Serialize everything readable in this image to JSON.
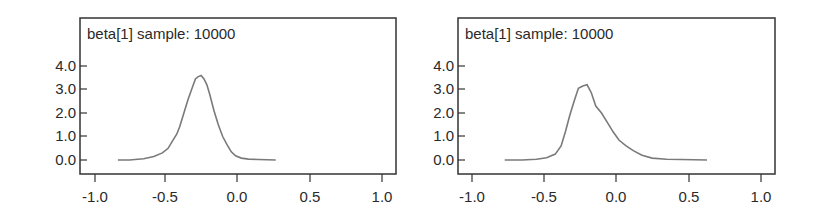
{
  "chart_data": [
    {
      "type": "line",
      "title": "beta[1] sample: 10000",
      "xlabel": "",
      "ylabel": "",
      "xlim": [
        -1.05,
        1.05
      ],
      "ylim": [
        -0.4,
        5.5
      ],
      "x_ticks": [
        "-1.0",
        "-0.5",
        "0.0",
        "0.5",
        "1.0"
      ],
      "y_ticks": [
        "0.0",
        "1.0",
        "2.0",
        "3.0",
        "4.0"
      ],
      "grid": false,
      "legend": null,
      "line_color": "#7a7a7a",
      "x": [
        -0.83,
        -0.75,
        -0.65,
        -0.58,
        -0.52,
        -0.48,
        -0.45,
        -0.42,
        -0.4,
        -0.37,
        -0.34,
        -0.31,
        -0.29,
        -0.27,
        -0.25,
        -0.23,
        -0.21,
        -0.19,
        -0.16,
        -0.13,
        -0.1,
        -0.07,
        -0.04,
        -0.01,
        0.03,
        0.08,
        0.15,
        0.27
      ],
      "y": [
        0.0,
        0.0,
        0.05,
        0.15,
        0.3,
        0.5,
        0.8,
        1.1,
        1.4,
        2.0,
        2.6,
        3.1,
        3.45,
        3.55,
        3.6,
        3.45,
        3.2,
        2.8,
        2.1,
        1.5,
        1.0,
        0.65,
        0.35,
        0.18,
        0.08,
        0.04,
        0.02,
        0.0
      ]
    },
    {
      "type": "line",
      "title": "beta[1] sample: 10000",
      "xlabel": "",
      "ylabel": "",
      "xlim": [
        -1.05,
        1.05
      ],
      "ylim": [
        -0.4,
        5.5
      ],
      "x_ticks": [
        "-1.0",
        "-0.5",
        "0.0",
        "0.5",
        "1.0"
      ],
      "y_ticks": [
        "0.0",
        "1.0",
        "2.0",
        "3.0",
        "4.0"
      ],
      "grid": false,
      "legend": null,
      "line_color": "#7a7a7a",
      "x": [
        -0.77,
        -0.65,
        -0.55,
        -0.48,
        -0.42,
        -0.38,
        -0.35,
        -0.32,
        -0.29,
        -0.26,
        -0.23,
        -0.2,
        -0.17,
        -0.14,
        -0.1,
        -0.06,
        -0.02,
        0.02,
        0.07,
        0.12,
        0.18,
        0.25,
        0.35,
        0.45,
        0.63
      ],
      "y": [
        0.0,
        0.0,
        0.03,
        0.1,
        0.25,
        0.6,
        1.2,
        1.9,
        2.5,
        3.05,
        3.15,
        3.2,
        2.85,
        2.3,
        2.0,
        1.6,
        1.2,
        0.85,
        0.6,
        0.4,
        0.2,
        0.08,
        0.03,
        0.02,
        0.0
      ]
    }
  ],
  "panels": [
    {
      "title": "beta[1] sample: 10000",
      "x_ticks": [
        "-1.0",
        "-0.5",
        "0.0",
        "0.5",
        "1.0"
      ],
      "y_ticks": [
        "4.0",
        "3.0",
        "2.0",
        "1.0",
        "0.0"
      ]
    },
    {
      "title": "beta[1] sample: 10000",
      "x_ticks": [
        "-1.0",
        "-0.5",
        "0.0",
        "0.5",
        "1.0"
      ],
      "y_ticks": [
        "4.0",
        "3.0",
        "2.0",
        "1.0",
        "0.0"
      ]
    }
  ]
}
